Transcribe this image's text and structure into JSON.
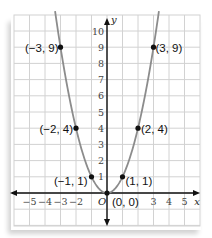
{
  "chart_data": {
    "type": "scatter",
    "title": "",
    "xlabel": "x",
    "ylabel": "y",
    "function": "y = x^2",
    "xlim": [
      -6,
      6
    ],
    "ylim": [
      -2,
      11
    ],
    "grid": true,
    "x_ticks": [
      "-5",
      "-4",
      "-3",
      "-2",
      "3",
      "4",
      "5"
    ],
    "y_ticks": [
      "1",
      "2",
      "3",
      "4",
      "5",
      "6",
      "7",
      "8",
      "9",
      "10"
    ],
    "origin_label": "O",
    "points": [
      {
        "x": -3,
        "y": 9,
        "label": "(−3, 9)"
      },
      {
        "x": -2,
        "y": 4,
        "label": "(−2, 4)"
      },
      {
        "x": -1,
        "y": 1,
        "label": "(−1, 1)"
      },
      {
        "x": 0,
        "y": 0,
        "label": "(0, 0)"
      },
      {
        "x": 1,
        "y": 1,
        "label": "(1, 1)"
      },
      {
        "x": 2,
        "y": 4,
        "label": "(2, 4)"
      },
      {
        "x": 3,
        "y": 9,
        "label": "(3, 9)"
      }
    ],
    "colors": {
      "curve": "#8c8c8c",
      "grid": "#d2d2d2",
      "axis": "#111111",
      "point": "#111111"
    }
  }
}
